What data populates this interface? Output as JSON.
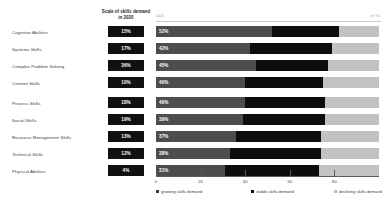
{
  "badge_header": "Scale of skills demand in 2020",
  "axis_endpoints": {
    "left": "2020",
    "right": "(in %)"
  },
  "legend": [
    {
      "key": "grow",
      "label": "growing skills demand"
    },
    {
      "key": "stable",
      "label": "stable skills demand"
    },
    {
      "key": "decline",
      "label": "declining skills demand"
    }
  ],
  "colors": {
    "growing": "#4d4d4d",
    "stable": "#0d0d0d",
    "declining": "#c2c2c2",
    "badge": "#111111",
    "track": "#ededed"
  },
  "chart_data": {
    "type": "bar",
    "orientation": "horizontal",
    "stacked": true,
    "title": "Scale of skills demand in 2020",
    "xlabel": "",
    "ylabel": "",
    "xlim": [
      0,
      100
    ],
    "grid": false,
    "legend_position": "bottom",
    "ticks": [
      0,
      20,
      40,
      60,
      80
    ],
    "categories": [
      "Cognitive Abilities",
      "Systems Skills",
      "Complex Problem Solving",
      "Content Skills",
      "Process Skills",
      "Social Skills",
      "Resource Management Skills",
      "Technical Skills",
      "Physical Abilities"
    ],
    "share_of_demand": [
      "15%",
      "17%",
      "36%",
      "10%",
      "18%",
      "19%",
      "13%",
      "12%",
      "4%"
    ],
    "series": [
      {
        "name": "growing skills demand",
        "values": [
          52,
          42,
          45,
          40,
          40,
          39,
          36,
          33,
          31
        ]
      },
      {
        "name": "stable skills demand",
        "values": [
          30,
          37,
          32,
          35,
          36,
          37,
          38,
          41,
          42
        ]
      },
      {
        "name": "declining skills demand",
        "values": [
          18,
          21,
          23,
          25,
          24,
          24,
          26,
          26,
          27
        ]
      }
    ],
    "bar_labels": [
      "52%",
      "42%",
      "45%",
      "40%",
      "40%",
      "39%",
      "37%",
      "38%",
      "31%"
    ]
  }
}
